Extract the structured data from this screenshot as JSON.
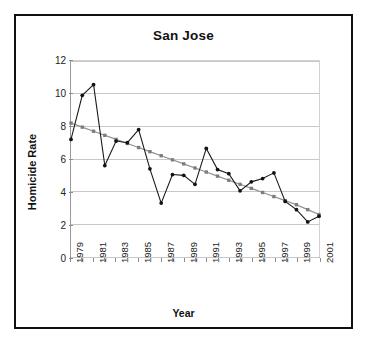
{
  "chart_data": {
    "type": "line",
    "title": "San Jose",
    "xlabel": "Year",
    "ylabel": "Homicide Rate",
    "grid": "horizontal",
    "legend": "none",
    "xlim": [
      1979,
      2001
    ],
    "ylim": [
      0,
      12
    ],
    "ytick_values": [
      0,
      2,
      4,
      6,
      8,
      10,
      12
    ],
    "ytick_labels": [
      "0",
      "2",
      "4",
      "6",
      "8",
      "10",
      "12"
    ],
    "xtick_labels": [
      "1979",
      "1981",
      "1983",
      "1985",
      "1987",
      "1989",
      "1991",
      "1993",
      "1995",
      "1997",
      "1999",
      "2001"
    ],
    "xtick_rotation": -90,
    "x": [
      1979,
      1980,
      1981,
      1982,
      1983,
      1984,
      1985,
      1986,
      1987,
      1988,
      1989,
      1990,
      1991,
      1992,
      1993,
      1994,
      1995,
      1996,
      1997,
      1998,
      1999,
      2000,
      2001
    ],
    "series": [
      {
        "name": "Homicide Rate",
        "color": "#1a1a1a",
        "marker": "circle",
        "values": [
          7.2,
          9.9,
          10.55,
          5.6,
          7.1,
          7.0,
          7.8,
          5.4,
          3.3,
          5.05,
          5.0,
          4.45,
          6.65,
          5.35,
          5.1,
          4.05,
          4.6,
          4.8,
          5.15,
          3.4,
          2.9,
          2.15,
          2.5
        ]
      },
      {
        "name": "Linear trend",
        "color": "#8e8e8e",
        "marker": "square",
        "values": [
          8.2,
          7.95,
          7.7,
          7.45,
          7.2,
          6.95,
          6.7,
          6.45,
          6.2,
          5.95,
          5.7,
          5.45,
          5.2,
          4.95,
          4.7,
          4.45,
          4.2,
          3.95,
          3.7,
          3.45,
          3.2,
          2.9,
          2.6
        ]
      }
    ]
  }
}
